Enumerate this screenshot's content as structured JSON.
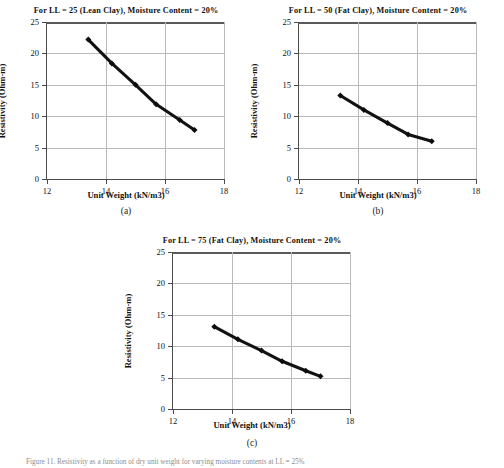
{
  "figure": {
    "caption": "Figure 11. Resistivity as a function of dry unit weight for varying moisture contents at LL = 25%"
  },
  "axes_common": {
    "xlabel": "Unit Weight (kN/m3)",
    "ylabel": "Resistivity (Ohm-m)",
    "xticks": [
      "12",
      "14",
      "16",
      "18"
    ],
    "yticks": [
      "0",
      "5",
      "10",
      "15",
      "20",
      "25"
    ]
  },
  "chart_data": [
    {
      "id": "a",
      "type": "line",
      "title": "For LL = 25 (Lean Clay), Moisture Content = 20%",
      "subcaption": "(a)",
      "xlabel": "Unit Weight (kN/m3)",
      "ylabel": "Resistivity (Ohm-m)",
      "xlim": [
        12,
        18
      ],
      "ylim": [
        0,
        25
      ],
      "xticks": [
        12,
        14,
        16,
        18
      ],
      "yticks": [
        0,
        5,
        10,
        15,
        20,
        25
      ],
      "grid": true,
      "legend": "none",
      "marker": "diamond",
      "x": [
        13.4,
        14.2,
        15.0,
        15.7,
        16.5,
        17.0
      ],
      "y": [
        22.2,
        18.4,
        15.0,
        11.9,
        9.4,
        7.8
      ]
    },
    {
      "id": "b",
      "type": "line",
      "title": "For LL = 50 (Fat Clay), Moisture Content = 20%",
      "subcaption": "(b)",
      "xlabel": "Unit Weight (kN/m3)",
      "ylabel": "Resistivity (Ohm-m)",
      "xlim": [
        12,
        18
      ],
      "ylim": [
        0,
        25
      ],
      "xticks": [
        12,
        14,
        16,
        18
      ],
      "yticks": [
        0,
        5,
        10,
        15,
        20,
        25
      ],
      "grid": true,
      "legend": "none",
      "marker": "diamond",
      "x": [
        13.4,
        14.2,
        15.0,
        15.7,
        16.5
      ],
      "y": [
        13.3,
        11.0,
        8.9,
        7.1,
        6.0
      ]
    },
    {
      "id": "c",
      "type": "line",
      "title": "For LL = 75 (Fat Clay), Moisture Content = 20%",
      "subcaption": "(c)",
      "xlabel": "Unit Weight (kN/m3)",
      "ylabel": "Resistivity (Ohm-m)",
      "xlim": [
        12,
        18
      ],
      "ylim": [
        0,
        25
      ],
      "xticks": [
        12,
        14,
        16,
        18
      ],
      "yticks": [
        0,
        5,
        10,
        15,
        20,
        25
      ],
      "grid": true,
      "legend": "none",
      "marker": "diamond",
      "x": [
        13.4,
        14.2,
        15.0,
        15.7,
        16.5,
        17.0
      ],
      "y": [
        13.1,
        11.1,
        9.3,
        7.6,
        6.1,
        5.2
      ]
    }
  ]
}
